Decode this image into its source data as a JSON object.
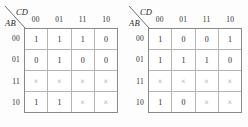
{
  "figure": {
    "type": "karnaugh-map-pair",
    "maps": [
      {
        "id": "kmap-left",
        "column_variable_label": "CD",
        "row_variable_label": "AB",
        "column_headers": [
          "00",
          "01",
          "11",
          "10"
        ],
        "row_headers": [
          "00",
          "01",
          "11",
          "10"
        ],
        "cells": [
          [
            "1",
            "1",
            "1",
            "0"
          ],
          [
            "0",
            "1",
            "0",
            "0"
          ],
          [
            "×",
            "×",
            "×",
            "×"
          ],
          [
            "1",
            "1",
            "×",
            "×"
          ]
        ]
      },
      {
        "id": "kmap-right",
        "column_variable_label": "CD",
        "row_variable_label": "AB",
        "column_headers": [
          "00",
          "01",
          "11",
          "10"
        ],
        "row_headers": [
          "00",
          "01",
          "11",
          "10"
        ],
        "cells": [
          [
            "1",
            "0",
            "0",
            "1"
          ],
          [
            "1",
            "1",
            "1",
            "0"
          ],
          [
            "×",
            "×",
            "×",
            "×"
          ],
          [
            "1",
            "0",
            "×",
            "×"
          ]
        ]
      }
    ],
    "colors": {
      "background": "#fdfdfd",
      "outer_border": "#8a8a8a",
      "inner_grid": "#b4b4b4",
      "text": "#2a2a2a",
      "dontcare": "#9a9a9a"
    }
  }
}
